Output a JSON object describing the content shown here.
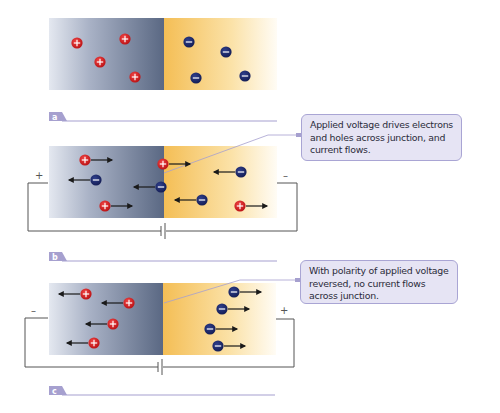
{
  "colors": {
    "p_region_dark": "#5d6b86",
    "p_region_light": "#e3e7ef",
    "n_region_dark": "#f5c25a",
    "n_region_light": "#fffaf0",
    "hole_fill": "#d91c1c",
    "electron_fill": "#1c2a6e",
    "arrow": "#1a1a1a",
    "wire": "#555555",
    "tag_fill": "#a6a0cf",
    "tag_line": "#a6a0cf",
    "callout_fill": "#e6e4f4",
    "callout_border": "#a9a5d4",
    "leader_line": "#a6a0cf"
  },
  "panels": [
    {
      "id": "a",
      "tag_label": "a",
      "has_circuit": false,
      "left_terminal_sign": "",
      "right_terminal_sign": "",
      "carriers": [
        {
          "type": "hole",
          "arrow": "none"
        },
        {
          "type": "hole",
          "arrow": "none"
        },
        {
          "type": "hole",
          "arrow": "none"
        },
        {
          "type": "hole",
          "arrow": "none"
        },
        {
          "type": "electron",
          "arrow": "none"
        },
        {
          "type": "electron",
          "arrow": "none"
        },
        {
          "type": "electron",
          "arrow": "none"
        },
        {
          "type": "electron",
          "arrow": "none"
        }
      ]
    },
    {
      "id": "b",
      "tag_label": "b",
      "has_circuit": true,
      "left_terminal_sign": "+",
      "right_terminal_sign": "–",
      "callout": "Applied voltage drives electrons and holes across junction, and current flows.",
      "carriers": [
        {
          "type": "hole",
          "arrow": "right"
        },
        {
          "type": "electron",
          "arrow": "left"
        },
        {
          "type": "hole",
          "arrow": "right"
        },
        {
          "type": "hole",
          "arrow": "right"
        },
        {
          "type": "electron",
          "arrow": "left"
        },
        {
          "type": "electron",
          "arrow": "left"
        },
        {
          "type": "electron",
          "arrow": "left"
        },
        {
          "type": "hole",
          "arrow": "right"
        }
      ]
    },
    {
      "id": "c",
      "tag_label": "c",
      "has_circuit": true,
      "left_terminal_sign": "–",
      "right_terminal_sign": "+",
      "callout": "With polarity of applied voltage reversed, no current flows across junction.",
      "carriers": [
        {
          "type": "hole",
          "arrow": "left"
        },
        {
          "type": "hole",
          "arrow": "left"
        },
        {
          "type": "hole",
          "arrow": "left"
        },
        {
          "type": "hole",
          "arrow": "left"
        },
        {
          "type": "electron",
          "arrow": "right"
        },
        {
          "type": "electron",
          "arrow": "right"
        },
        {
          "type": "electron",
          "arrow": "right"
        },
        {
          "type": "electron",
          "arrow": "right"
        }
      ]
    }
  ]
}
